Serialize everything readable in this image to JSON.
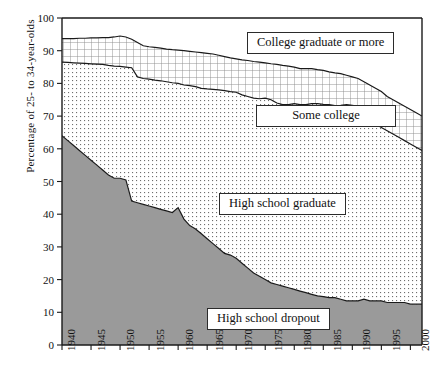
{
  "chart_data": {
    "type": "area",
    "stacked": true,
    "title": "",
    "xlabel": "",
    "ylabel": "Percentage of 25- to 34-year-olds",
    "xlim": [
      1940,
      2002
    ],
    "ylim": [
      0,
      100
    ],
    "ytick_values": [
      0,
      10,
      20,
      30,
      40,
      50,
      60,
      70,
      80,
      90,
      100
    ],
    "ytick_labels": [
      "0",
      "10",
      "20",
      "30",
      "40",
      "50",
      "60",
      "70",
      "80",
      "90",
      "100"
    ],
    "xtick_values": [
      1940,
      1945,
      1950,
      1955,
      1960,
      1965,
      1970,
      1975,
      1980,
      1985,
      1990,
      1995,
      2000
    ],
    "xtick_labels": [
      "1940",
      "1945",
      "1950",
      "1955",
      "1960",
      "1965",
      "1970",
      "1975",
      "1980",
      "1985",
      "1990",
      "1995",
      "2000"
    ],
    "grid": false,
    "legend_position": "inside-boxes",
    "x": [
      1940,
      1941,
      1942,
      1943,
      1944,
      1945,
      1946,
      1947,
      1948,
      1949,
      1950,
      1951,
      1952,
      1953,
      1954,
      1955,
      1956,
      1957,
      1958,
      1959,
      1960,
      1961,
      1962,
      1963,
      1964,
      1965,
      1966,
      1967,
      1968,
      1969,
      1970,
      1971,
      1972,
      1973,
      1974,
      1975,
      1976,
      1977,
      1978,
      1979,
      1980,
      1981,
      1982,
      1983,
      1984,
      1985,
      1986,
      1987,
      1988,
      1989,
      1990,
      1991,
      1992,
      1993,
      1994,
      1995,
      1996,
      1997,
      1998,
      1999,
      2000,
      2001,
      2002
    ],
    "series": [
      {
        "name": "High school dropout",
        "label": "High school dropout",
        "fill": "#9a9a9a",
        "pattern": "solid-gray",
        "values": [
          64,
          62.5,
          61,
          59.5,
          58,
          56.5,
          55,
          53.5,
          52,
          51,
          51,
          50.5,
          44,
          43.5,
          43,
          42.5,
          42,
          41.5,
          41,
          40.5,
          42,
          38.5,
          36.5,
          35.5,
          34,
          32.5,
          31,
          29.5,
          28,
          27.5,
          26.5,
          25,
          23.5,
          22,
          21,
          20,
          19,
          18.5,
          18,
          17.5,
          17,
          16.5,
          16,
          15.5,
          15,
          14.8,
          14.5,
          14.5,
          14,
          13.5,
          13.5,
          13.5,
          14,
          13.5,
          13.5,
          13.5,
          13,
          13,
          13,
          13,
          12.5,
          12.5,
          12.5
        ]
      },
      {
        "name": "High school graduate",
        "label": "High school graduate",
        "fill": "#ffffff",
        "pattern": "dots",
        "cumulative_top": [
          86.5,
          86.4,
          86.3,
          86.2,
          86.1,
          86,
          85.9,
          85.8,
          85.5,
          85.3,
          85.2,
          85,
          84.8,
          82,
          81.5,
          81.3,
          81,
          80.8,
          80.5,
          80.2,
          80,
          79.5,
          79.3,
          79,
          78.5,
          78.3,
          78.2,
          78,
          77.8,
          77.5,
          77.3,
          76.5,
          76,
          75.5,
          75.3,
          75.5,
          75,
          74,
          73.5,
          73.5,
          73.8,
          73.5,
          73.5,
          73.8,
          73.8,
          73.6,
          73.5,
          73.2,
          73.3,
          73.5,
          73.3,
          73,
          70,
          68.5,
          67.5,
          66.5,
          65.5,
          64.5,
          63.5,
          62.5,
          61.5,
          60.5,
          59.5
        ]
      },
      {
        "name": "Some college",
        "label": "Some college",
        "fill": "#ffffff",
        "pattern": "grid",
        "cumulative_top": [
          93.7,
          93.7,
          93.7,
          93.8,
          93.8,
          93.9,
          93.9,
          94,
          94,
          94.2,
          94.5,
          94.2,
          93.5,
          92.5,
          91.5,
          91.2,
          91,
          90.8,
          90.5,
          90.3,
          90.2,
          90,
          89.8,
          89.6,
          89.4,
          89.2,
          89,
          88.6,
          88.2,
          87.8,
          87.5,
          87.2,
          87,
          86.7,
          86.5,
          86.3,
          86,
          85.8,
          85.5,
          85.3,
          85,
          84.5,
          84.5,
          84.5,
          84.2,
          84,
          83.5,
          83.2,
          83,
          82.5,
          82,
          81.5,
          80.5,
          79.5,
          78.5,
          77.5,
          76,
          75,
          74,
          73,
          72,
          71,
          70
        ]
      },
      {
        "name": "College graduate or more",
        "label": "College graduate or more",
        "fill": "#ffffff",
        "pattern": "plain",
        "cumulative_top": [
          100,
          100,
          100,
          100,
          100,
          100,
          100,
          100,
          100,
          100,
          100,
          100,
          100,
          100,
          100,
          100,
          100,
          100,
          100,
          100,
          100,
          100,
          100,
          100,
          100,
          100,
          100,
          100,
          100,
          100,
          100,
          100,
          100,
          100,
          100,
          100,
          100,
          100,
          100,
          100,
          100,
          100,
          100,
          100,
          100,
          100,
          100,
          100,
          100,
          100,
          100,
          100,
          100,
          100,
          100,
          100,
          100,
          100,
          100,
          100,
          100,
          100,
          100
        ]
      }
    ],
    "legend_labels": [
      "College graduate or more",
      "Some college",
      "High school graduate",
      "High school dropout"
    ],
    "colors": {
      "dropout_fill": "#9a9a9a",
      "line": "#1a1a1a",
      "axis": "#1a1a1a",
      "background": "#ffffff"
    }
  }
}
